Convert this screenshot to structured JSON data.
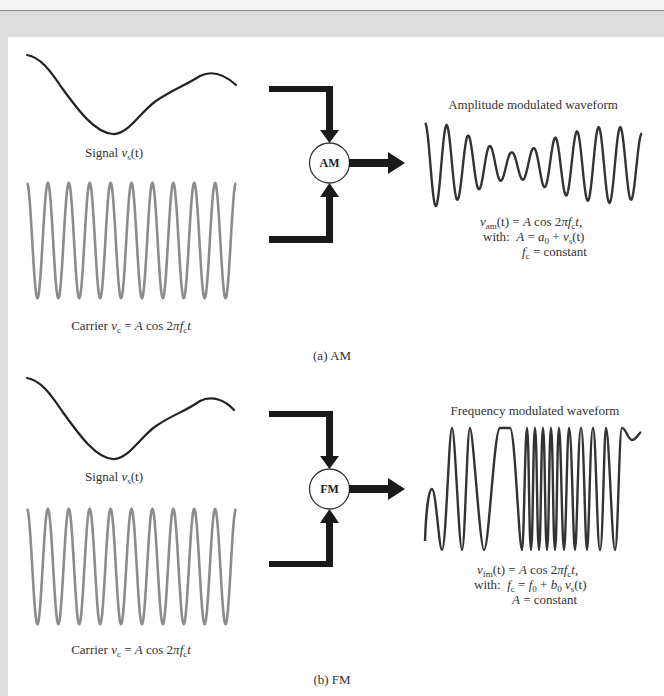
{
  "figure": {
    "colors": {
      "signal": "#222222",
      "carrier": "#8c8c8c",
      "modulated": "#333333",
      "arrows": "#1a1a1a",
      "frame": "#dcdcdc"
    },
    "am": {
      "signal_label": {
        "prefix": "Signal ",
        "var": "v",
        "sub": "s",
        "arg": "(t)"
      },
      "carrier_label": {
        "prefix": "Carrier ",
        "var": "v",
        "sub": "c",
        "eq": " = ",
        "A": "A",
        "cos": " cos 2",
        "pi": "π",
        "f": "f",
        "fsub": "c",
        "t": "t"
      },
      "block_label": "AM",
      "output_title": "Amplitude modulated waveform",
      "formula": {
        "line1": {
          "var": "v",
          "sub": "am",
          "arg": "(t)",
          "eq": " = ",
          "A": "A",
          "cos": " cos 2",
          "pi": "π",
          "f": "f",
          "fsub": "c",
          "t": "t",
          "end": ","
        },
        "line2": {
          "with": "with:  ",
          "A": "A",
          "eq": " = ",
          "a": "a",
          "asub": "0",
          "plus": " + ",
          "v": "v",
          "vsub": "s",
          "arg": "(t)"
        },
        "line3": {
          "f": "f",
          "fsub": "c",
          "rest": " = constant"
        }
      },
      "caption": "(a) AM",
      "carrier_cycles": 10,
      "output_cycles": 10
    },
    "fm": {
      "signal_label": {
        "prefix": "Signal ",
        "var": "v",
        "sub": "s",
        "arg": "(t)"
      },
      "carrier_label": {
        "prefix": "Carrier ",
        "var": "v",
        "sub": "c",
        "eq": " = ",
        "A": "A",
        "cos": " cos 2",
        "pi": "π",
        "f": "f",
        "fsub": "c",
        "t": "t"
      },
      "block_label": "FM",
      "output_title": "Frequency modulated waveform",
      "formula": {
        "line1": {
          "var": "v",
          "sub": "fm",
          "arg": "(t)",
          "eq": " = ",
          "A": "A",
          "cos": " cos 2",
          "pi": "π",
          "f": "f",
          "fsub": "c",
          "t": "t",
          "end": ","
        },
        "line2": {
          "with": "with:  ",
          "f": "f",
          "fsub": "c",
          "eq": " = ",
          "f0": "f",
          "f0sub": "0",
          "plus": " + ",
          "b": "b",
          "bsub": "0",
          "v": " v",
          "vsub": "s",
          "arg": "(t)"
        },
        "line3": {
          "A": "A",
          "rest": " = constant"
        }
      },
      "caption": "(b) FM",
      "carrier_cycles": 10
    }
  }
}
